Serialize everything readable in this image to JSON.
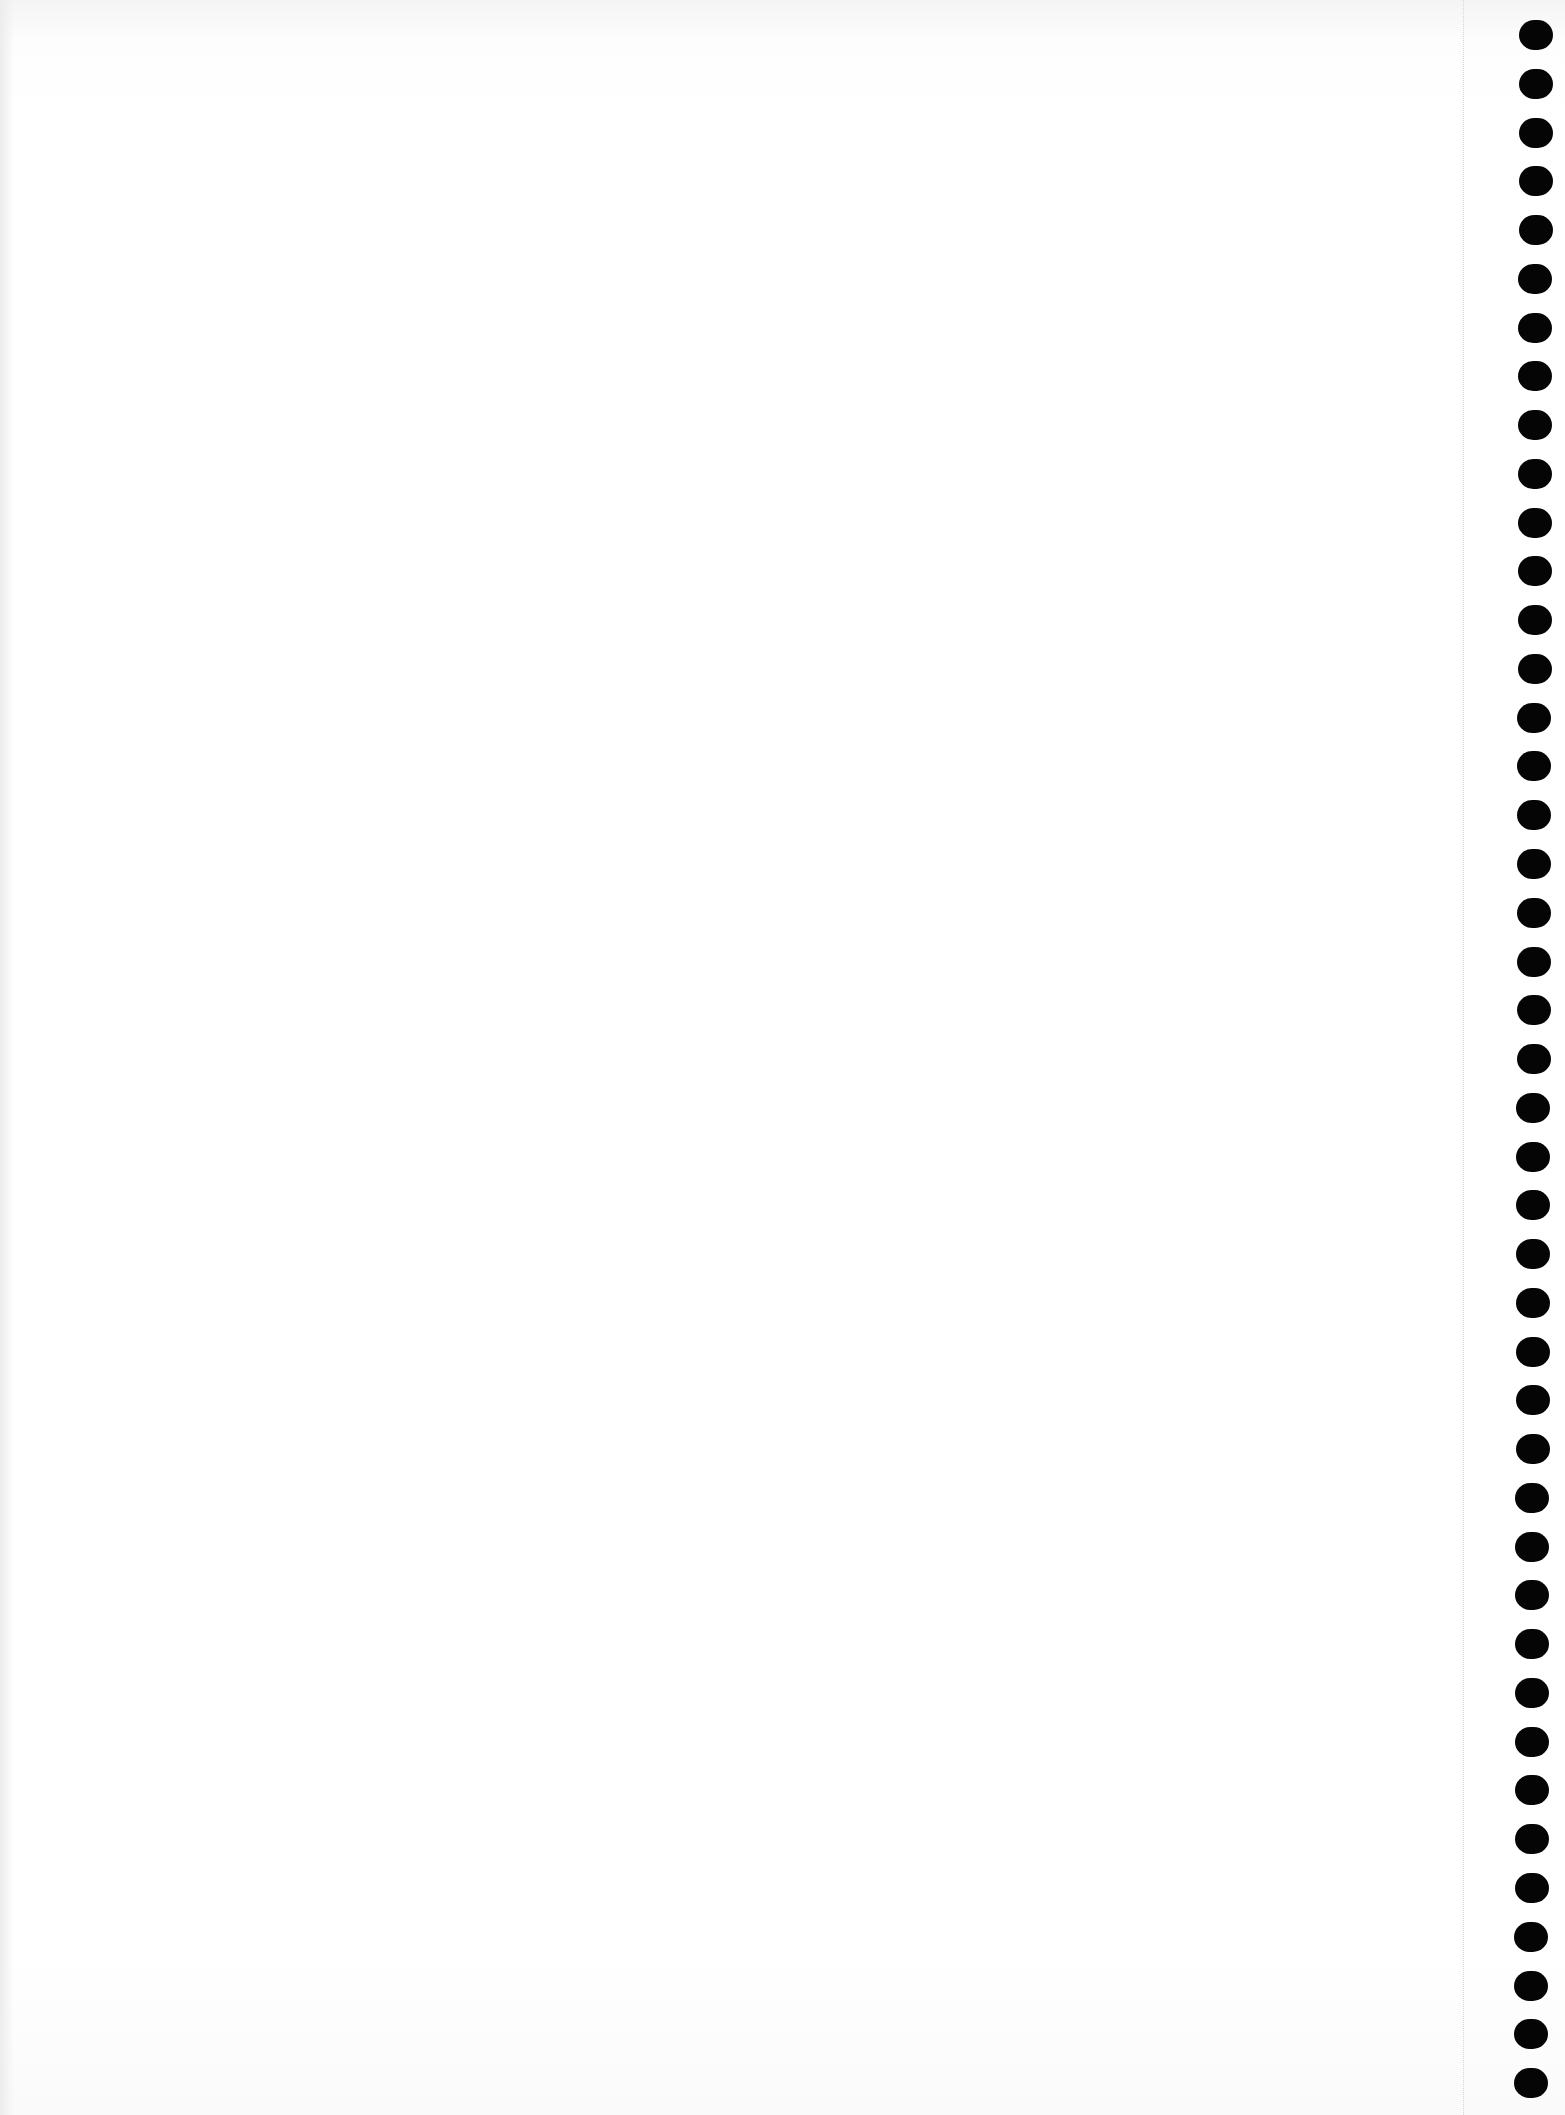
{
  "page": {
    "type": "blank spiral notebook page",
    "background_color": "#ffffff",
    "content_text": ""
  },
  "binding": {
    "side": "right",
    "hole_count": 43,
    "hole_color": "#050505",
    "first_hole_top": 20,
    "last_hole_top": 2068,
    "hole_width": 34,
    "hole_height": 30,
    "x_top": 1519,
    "x_bottom": 1514
  },
  "margin_line": {
    "x": 1463,
    "style": "dotted",
    "color": "#d6d6d6"
  }
}
